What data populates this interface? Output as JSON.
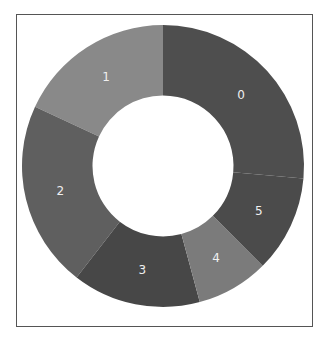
{
  "chart_data": {
    "type": "pie",
    "subtype": "donut",
    "title": "",
    "categories": [
      "0",
      "1",
      "2",
      "3",
      "4",
      "5"
    ],
    "values": [
      26.4,
      18.1,
      21.4,
      14.7,
      8.3,
      11.1
    ],
    "colors": [
      "#4e4e4e",
      "#898989",
      "#5f5f5f",
      "#474747",
      "#7b7b7b",
      "#4b4b4b"
    ],
    "label_positions": "inside, segment index shown",
    "start_angle_deg_clockwise_from_top": 0,
    "direction": "counterclockwise",
    "draw_order_note": "0 at top-right; 1,2,3,4,5 proceed counterclockwise",
    "hole_ratio": 0.5,
    "legend": "none"
  }
}
